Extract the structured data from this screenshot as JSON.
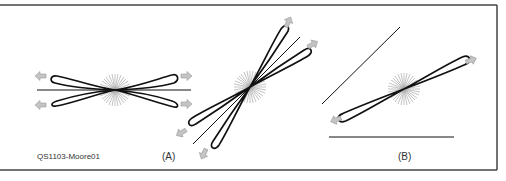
{
  "figure": {
    "id_label": "QS1103-Moore01",
    "panels": [
      {
        "label": "(A)",
        "description": "Horizontal and tilted dipole patterns with twin lobes"
      },
      {
        "label": "(B)",
        "description": "Tilted single dipole pattern with two reference lines"
      }
    ]
  },
  "colors": {
    "lobe": "#111111",
    "arrow": "#b0b0b0",
    "starburst": "#999999",
    "border": "#444444"
  }
}
